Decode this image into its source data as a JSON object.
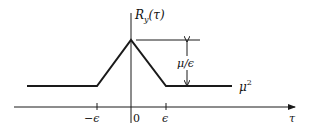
{
  "diagram": {
    "y_axis_label": "R",
    "y_axis_label_sub": "y",
    "y_axis_label_arg": "(τ)",
    "x_axis_label": "τ",
    "tick_labels": {
      "neg_eps": "−ϵ",
      "zero": "0",
      "pos_eps": "ϵ"
    },
    "height_label": "μ/ϵ",
    "baseline_label": "μ",
    "baseline_label_sup": "2",
    "colors": {
      "stroke": "#1a1a1a",
      "background": "#ffffff"
    }
  }
}
